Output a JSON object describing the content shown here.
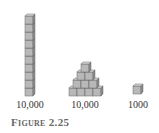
{
  "figure": {
    "caption": "Figure 2.25",
    "colors": {
      "cube_face": "#b8b8b8",
      "cube_top": "#d8d8d8",
      "cube_side": "#8c8c8c",
      "cube_edge": "#6a6a6a",
      "label_text": "#333333",
      "caption_text": "#666666"
    },
    "items": [
      {
        "shape": "rod",
        "cubes": 10,
        "label": "10,000"
      },
      {
        "shape": "pyramid",
        "rows": [
          1,
          2,
          3,
          4
        ],
        "label": "10,000"
      },
      {
        "shape": "single-cube",
        "cubes": 1,
        "label": "1000"
      }
    ]
  }
}
